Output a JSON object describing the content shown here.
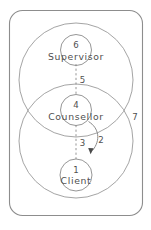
{
  "diagram": {
    "frame": {
      "label": "7",
      "name": "outer-boundary"
    },
    "systems": [
      {
        "name": "supervisor-system",
        "label": ""
      },
      {
        "name": "client-system",
        "label": ""
      }
    ],
    "nodes": [
      {
        "id": "supervisor",
        "number": "6",
        "label": "Supervisor"
      },
      {
        "id": "counsellor",
        "number": "4",
        "label": "Counsellor"
      },
      {
        "id": "client",
        "number": "1",
        "label": "Client"
      }
    ],
    "links": [
      {
        "id": "supervisor-counsellor",
        "label": "5",
        "style": "dashed"
      },
      {
        "id": "counsellor-client",
        "label": "3",
        "style": "dashed"
      },
      {
        "id": "counsellor-to-client-arrow",
        "label": "2",
        "style": "curved-arrow"
      }
    ],
    "colors": {
      "stroke": "#8a8a8a",
      "text": "#4f4f4f",
      "background": "#ffffff"
    }
  }
}
